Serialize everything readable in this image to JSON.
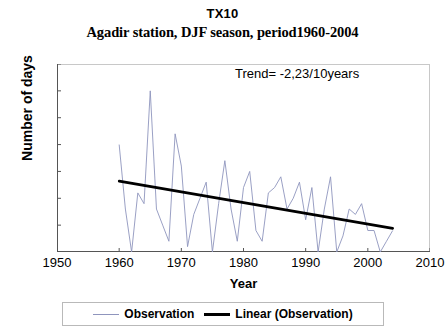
{
  "chart_data": {
    "type": "line",
    "title": "TX10",
    "subtitle": "Agadir station, DJF season, period1960-2004",
    "xlabel": "Year",
    "ylabel": "Number of days",
    "xlim": [
      1950,
      2010
    ],
    "ylim": [
      0,
      35
    ],
    "xticks": [
      1950,
      1960,
      1970,
      1980,
      1990,
      2000,
      2010
    ],
    "yticks": [
      0,
      5,
      10,
      15,
      20,
      25,
      30,
      35
    ],
    "grid": false,
    "legend_position": "bottom",
    "annotations": [
      {
        "text": "Trend= -2,23/10years",
        "x": 1987,
        "y": 32
      }
    ],
    "series": [
      {
        "name": "Observation",
        "color": "#8f95bd",
        "type": "line",
        "x": [
          1960,
          1961,
          1962,
          1963,
          1964,
          1965,
          1966,
          1967,
          1968,
          1969,
          1970,
          1971,
          1972,
          1973,
          1974,
          1975,
          1976,
          1977,
          1978,
          1979,
          1980,
          1981,
          1982,
          1983,
          1984,
          1985,
          1986,
          1987,
          1988,
          1989,
          1990,
          1991,
          1992,
          1993,
          1994,
          1995,
          1996,
          1997,
          1998,
          1999,
          2000,
          2001,
          2002,
          2003,
          2004
        ],
        "values": [
          20,
          8,
          0,
          11,
          9,
          30,
          8,
          5,
          2,
          22,
          16,
          1,
          7,
          10,
          13,
          0,
          9,
          17,
          8,
          2,
          12,
          15,
          4,
          2,
          11,
          12,
          14,
          8,
          10,
          13,
          6,
          12,
          0,
          8,
          14,
          0,
          3,
          8,
          7,
          9,
          4,
          4,
          0,
          2,
          4
        ]
      },
      {
        "name": "Linear (Observation)",
        "color": "#000000",
        "type": "trendline",
        "x": [
          1960,
          2004
        ],
        "values": [
          13.2,
          4.4
        ],
        "slope_per_decade": -2.23
      }
    ]
  },
  "legend": {
    "items": [
      {
        "label": "Observation",
        "style": "thin-line",
        "color": "#8f95bd"
      },
      {
        "label": "Linear (Observation)",
        "style": "thick-line",
        "color": "#000000"
      }
    ]
  }
}
